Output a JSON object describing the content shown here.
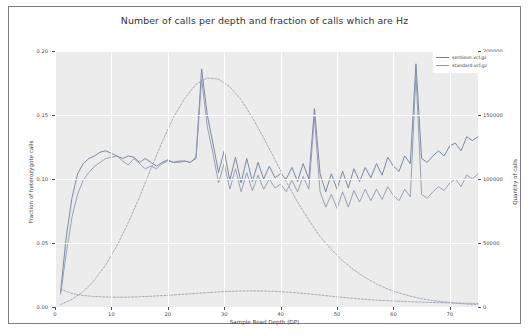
{
  "chart_data": {
    "type": "line",
    "title": "Number of calls per depth and fraction of calls which are Hz",
    "xlabel": "Sample Read Depth (DP)",
    "ylabel": "Fraction of heterozygote calls",
    "ylabel_right": "Quantity of calls",
    "xlim": [
      0,
      75
    ],
    "ylim": [
      0.0,
      0.2
    ],
    "ylim_right": [
      0,
      200000
    ],
    "grid": true,
    "legend_position": "top-right",
    "xticks": [
      "0",
      "10",
      "20",
      "30",
      "40",
      "50",
      "60",
      "70"
    ],
    "xtick_values": [
      0,
      10,
      20,
      30,
      40,
      50,
      60,
      70
    ],
    "yticks_left": [
      "0.00",
      "0.05",
      "0.10",
      "0.15",
      "0.20"
    ],
    "ytick_values_left": [
      0.0,
      0.05,
      0.1,
      0.15,
      0.2
    ],
    "yticks_right": [
      "0",
      "50000",
      "100000",
      "150000",
      "200000"
    ],
    "ytick_values_right": [
      0,
      50000,
      100000,
      150000,
      200000
    ],
    "series": [
      {
        "name": "sentieon.vcf.gz",
        "axis": "left",
        "style": "solid",
        "color": "#6b7f9e",
        "x": [
          1,
          2,
          3,
          4,
          5,
          6,
          7,
          8,
          9,
          10,
          11,
          12,
          13,
          14,
          15,
          16,
          17,
          18,
          19,
          20,
          21,
          22,
          23,
          24,
          25,
          26,
          27,
          28,
          29,
          30,
          31,
          32,
          33,
          34,
          35,
          36,
          37,
          38,
          39,
          40,
          41,
          42,
          43,
          44,
          45,
          46,
          47,
          48,
          49,
          50,
          51,
          52,
          53,
          54,
          55,
          56,
          57,
          58,
          59,
          60,
          61,
          62,
          63,
          64,
          65,
          66,
          67,
          68,
          69,
          70,
          71,
          72,
          73,
          74,
          75
        ],
        "y": [
          0.012,
          0.055,
          0.085,
          0.104,
          0.112,
          0.116,
          0.118,
          0.121,
          0.122,
          0.12,
          0.118,
          0.116,
          0.118,
          0.117,
          0.113,
          0.116,
          0.113,
          0.11,
          0.113,
          0.115,
          0.113,
          0.114,
          0.114,
          0.113,
          0.117,
          0.186,
          0.15,
          0.128,
          0.105,
          0.122,
          0.099,
          0.117,
          0.097,
          0.116,
          0.098,
          0.113,
          0.1,
          0.11,
          0.101,
          0.104,
          0.1,
          0.109,
          0.098,
          0.112,
          0.1,
          0.155,
          0.104,
          0.09,
          0.104,
          0.092,
          0.106,
          0.093,
          0.108,
          0.098,
          0.109,
          0.101,
          0.112,
          0.103,
          0.117,
          0.11,
          0.106,
          0.118,
          0.112,
          0.19,
          0.116,
          0.113,
          0.118,
          0.122,
          0.118,
          0.126,
          0.128,
          0.122,
          0.133,
          0.13,
          0.133
        ]
      },
      {
        "name": "standard.vcf.gz",
        "axis": "left",
        "style": "solid",
        "color": "#8d99ad",
        "x": [
          1,
          2,
          3,
          4,
          5,
          6,
          7,
          8,
          9,
          10,
          11,
          12,
          13,
          14,
          15,
          16,
          17,
          18,
          19,
          20,
          21,
          22,
          23,
          24,
          25,
          26,
          27,
          28,
          29,
          30,
          31,
          32,
          33,
          34,
          35,
          36,
          37,
          38,
          39,
          40,
          41,
          42,
          43,
          44,
          45,
          46,
          47,
          48,
          49,
          50,
          51,
          52,
          53,
          54,
          55,
          56,
          57,
          58,
          59,
          60,
          61,
          62,
          63,
          64,
          65,
          66,
          67,
          68,
          69,
          70,
          71,
          72,
          73,
          74,
          75
        ],
        "y": [
          0.01,
          0.042,
          0.07,
          0.088,
          0.099,
          0.105,
          0.11,
          0.113,
          0.116,
          0.117,
          0.118,
          0.114,
          0.111,
          0.116,
          0.112,
          0.108,
          0.11,
          0.108,
          0.112,
          0.114,
          0.113,
          0.113,
          0.114,
          0.113,
          0.116,
          0.178,
          0.141,
          0.12,
          0.097,
          0.112,
          0.092,
          0.108,
          0.09,
          0.105,
          0.091,
          0.103,
          0.092,
          0.1,
          0.093,
          0.096,
          0.09,
          0.099,
          0.09,
          0.102,
          0.092,
          0.148,
          0.09,
          0.078,
          0.088,
          0.077,
          0.09,
          0.078,
          0.091,
          0.082,
          0.092,
          0.083,
          0.092,
          0.084,
          0.094,
          0.087,
          0.083,
          0.092,
          0.086,
          0.182,
          0.088,
          0.085,
          0.09,
          0.094,
          0.091,
          0.097,
          0.1,
          0.094,
          0.103,
          0.1,
          0.104
        ]
      },
      {
        "name": "sentieon.vcf.gz quantity",
        "axis": "right",
        "style": "dashed",
        "color": "#9aa3b2",
        "x": [
          1,
          3,
          5,
          7,
          9,
          11,
          13,
          15,
          17,
          19,
          21,
          23,
          25,
          27,
          29,
          31,
          33,
          35,
          37,
          39,
          41,
          43,
          45,
          47,
          49,
          51,
          53,
          55,
          57,
          59,
          61,
          63,
          65,
          67,
          69,
          71,
          73,
          75
        ],
        "y": [
          2000,
          6000,
          12000,
          21000,
          33000,
          48000,
          66000,
          86000,
          108000,
          129000,
          148000,
          163000,
          174000,
          179000,
          178000,
          172000,
          162000,
          148000,
          132000,
          115000,
          98000,
          82000,
          68000,
          55000,
          45000,
          36000,
          29000,
          23000,
          18000,
          14000,
          11000,
          8500,
          6500,
          5000,
          4000,
          3000,
          2300,
          1800
        ]
      },
      {
        "name": "standard.vcf.gz quantity",
        "axis": "right",
        "style": "dashed",
        "color": "#9aa3b2",
        "x": [
          1,
          3,
          5,
          7,
          9,
          11,
          13,
          15,
          17,
          19,
          21,
          23,
          25,
          27,
          29,
          31,
          33,
          35,
          37,
          39,
          41,
          43,
          45,
          47,
          49,
          51,
          53,
          55,
          57,
          59,
          61,
          63,
          65,
          67,
          69,
          71,
          73,
          75
        ],
        "y": [
          14000,
          10500,
          9000,
          8200,
          7800,
          7600,
          7700,
          8000,
          8400,
          8900,
          9400,
          10000,
          10600,
          11200,
          11800,
          12200,
          12500,
          12600,
          12500,
          12200,
          11700,
          11000,
          10200,
          9300,
          8400,
          7500,
          6700,
          6000,
          5400,
          4900,
          4500,
          4100,
          3800,
          3500,
          3300,
          3100,
          2900,
          2800
        ]
      }
    ]
  },
  "legend": {
    "entries": [
      {
        "label": "sentieon.vcf.gz"
      },
      {
        "label": "standard.vcf.gz"
      }
    ]
  }
}
